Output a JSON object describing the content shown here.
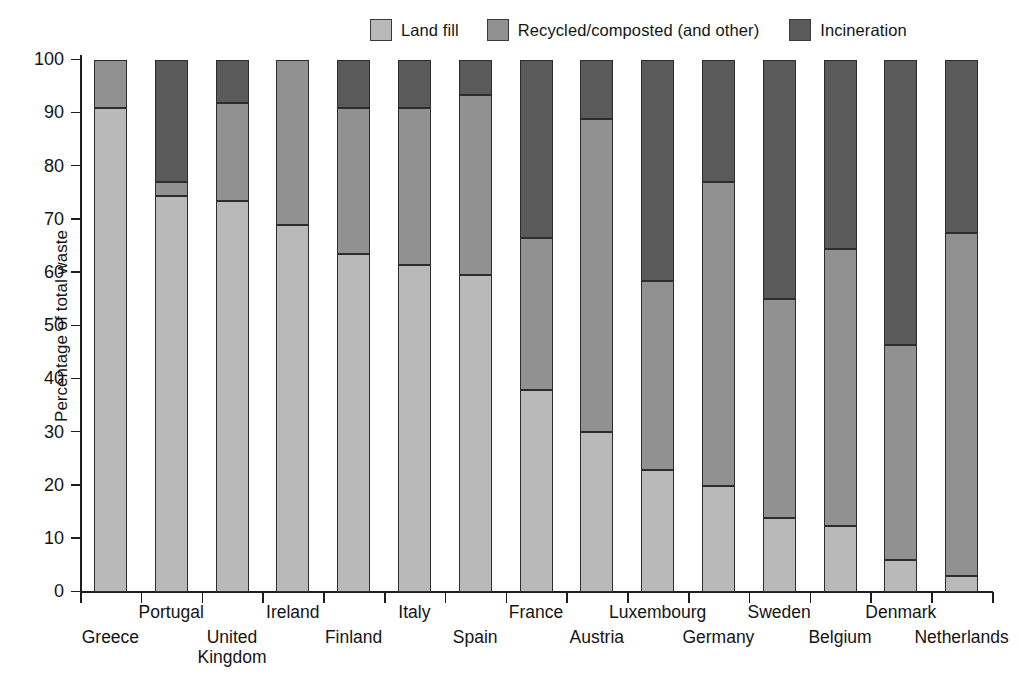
{
  "chart_data": {
    "type": "bar",
    "subtype": "stacked-bar-100",
    "title": "",
    "xlabel": "",
    "ylabel": "Percentage of total waste",
    "ylim": [
      0,
      100
    ],
    "ytick_values": [
      0,
      10,
      20,
      30,
      40,
      50,
      60,
      70,
      80,
      90,
      100
    ],
    "ytick_labels": [
      "0",
      "10",
      "20",
      "30",
      "40",
      "50",
      "60",
      "70",
      "80",
      "90",
      "100"
    ],
    "grid": false,
    "legend_position": "top-right",
    "categories": [
      "Greece",
      "Portugal",
      "United\nKingdom",
      "Ireland",
      "Finland",
      "Italy",
      "Spain",
      "France",
      "Austria",
      "Luxembourg",
      "Germany",
      "Sweden",
      "Belgium",
      "Denmark",
      "Netherlands"
    ],
    "series": [
      {
        "name": "Land fill",
        "color": "#b9b9b9",
        "values": [
          91,
          74.5,
          73.5,
          69,
          63.5,
          61.5,
          59.5,
          38,
          30,
          23,
          20,
          14,
          12.5,
          6,
          3
        ]
      },
      {
        "name": "Recycled/composted (and other)",
        "color": "#919191",
        "values": [
          9,
          2.5,
          18.5,
          31,
          27.5,
          29.5,
          34,
          28.5,
          59,
          35.5,
          57,
          41,
          52,
          40.5,
          64.5
        ]
      },
      {
        "name": "Incineration",
        "color": "#5a5a5a",
        "values": [
          0,
          23,
          8,
          0,
          9,
          9,
          6.5,
          33.5,
          11,
          41.5,
          23,
          45,
          35.5,
          53.5,
          32.5
        ]
      }
    ]
  },
  "legend": {
    "items": [
      {
        "label": "Land fill",
        "color": "#b9b9b9"
      },
      {
        "label": "Recycled/composted (and other)",
        "color": "#919191"
      },
      {
        "label": "Incineration",
        "color": "#5a5a5a"
      }
    ]
  }
}
